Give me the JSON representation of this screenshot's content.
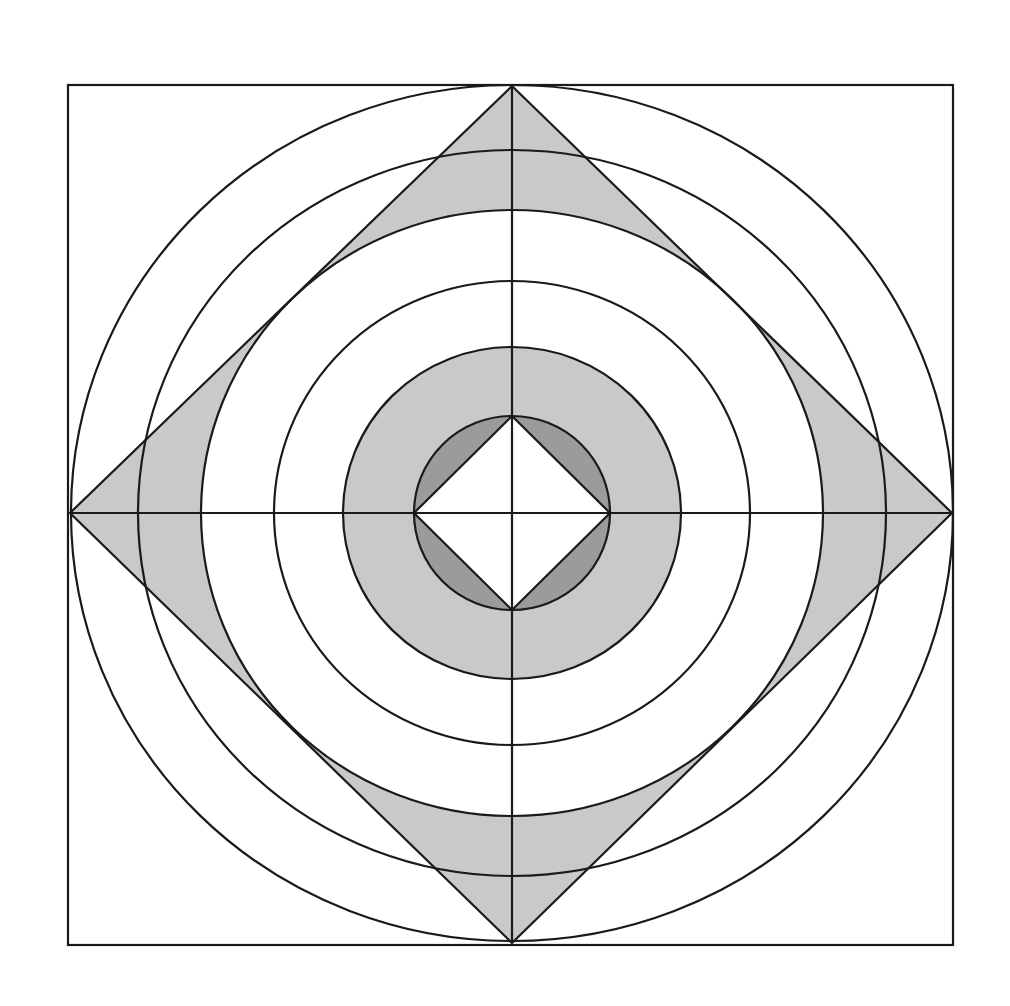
{
  "diagram": {
    "type": "geometric-construction",
    "colors": {
      "background": "#ffffff",
      "stroke": "#1a1a1a",
      "light_fill": "#c9c9c9",
      "dark_fill": "#9b9b9b",
      "center_fill": "#ffffff"
    },
    "center": [
      512,
      513
    ],
    "frame_square": {
      "x1": 68,
      "y1": 85,
      "x2": 953,
      "y2": 945
    },
    "outer_diamond": [
      [
        512,
        86
      ],
      [
        952,
        513
      ],
      [
        512,
        943
      ],
      [
        70,
        513
      ]
    ],
    "rings": [
      {
        "name": "outer-circle",
        "rx": 441,
        "ry": 428
      },
      {
        "name": "circle-2",
        "rx": 374,
        "ry": 363
      },
      {
        "name": "circle-3",
        "rx": 311,
        "ry": 303
      },
      {
        "name": "circle-4",
        "rx": 238,
        "ry": 232
      },
      {
        "name": "circle-5",
        "rx": 169,
        "ry": 166
      },
      {
        "name": "inner-circle",
        "rx": 98,
        "ry": 97
      }
    ],
    "inner_diamond": [
      [
        512,
        416
      ],
      [
        610,
        513
      ],
      [
        512,
        610
      ],
      [
        414,
        513
      ]
    ],
    "axes": {
      "vertical": {
        "x": 512,
        "y1": 86,
        "y2": 943
      },
      "horizontal": {
        "y": 513,
        "x1": 70,
        "x2": 952
      }
    }
  }
}
